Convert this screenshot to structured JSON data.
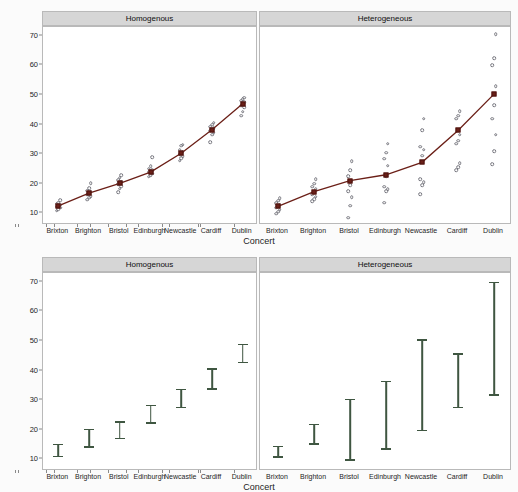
{
  "figure": {
    "xlabel": "Concert",
    "ylabel": "Ringing in Ears (Hours)",
    "panel_titles": [
      "Homogenous",
      "Heterogeneous"
    ],
    "categories": [
      "Brixton",
      "Brighton",
      "Bristol",
      "Edinburgh",
      "Newcastle",
      "Cardiff",
      "Dublin"
    ],
    "yticks": [
      10,
      20,
      30,
      40,
      50,
      60,
      70
    ],
    "ylim": [
      6,
      73
    ],
    "colors": {
      "mean_marker": "#6b1f17",
      "observation": "#77777f",
      "errorbar": "#3f5641",
      "strip_background": "#d6d6d6",
      "panel_border": "#b9b9b9",
      "background": "#fbfbfb"
    }
  },
  "chart_data": [
    {
      "type": "scatter",
      "title": "Homogenous",
      "panel": "top-left",
      "xlabel": "Concert",
      "ylabel": "Ringing in Ears (Hours)",
      "ylim": [
        6,
        73
      ],
      "yticks": [
        10,
        20,
        30,
        40,
        50,
        60,
        70
      ],
      "grid": false,
      "categories": [
        "Brixton",
        "Brighton",
        "Bristol",
        "Edinburgh",
        "Newcastle",
        "Cardiff",
        "Dublin"
      ],
      "series": [
        {
          "name": "Group mean",
          "marker": "filled-square",
          "connected": true,
          "values": [
            12.5,
            16.8,
            20.1,
            23.9,
            30.3,
            38.2,
            47.0
          ]
        }
      ],
      "observations": [
        {
          "category": "Brixton",
          "values": [
            10.9,
            11.4,
            11.8,
            12.2,
            12.5,
            12.8,
            13.2,
            13.6,
            14.3
          ]
        },
        {
          "category": "Brighton",
          "values": [
            14.5,
            15.2,
            15.8,
            16.3,
            16.8,
            17.2,
            17.6,
            18.4,
            20.2
          ]
        },
        {
          "category": "Bristol",
          "values": [
            17.0,
            18.3,
            19.2,
            19.8,
            20.1,
            20.6,
            21.2,
            22.0,
            22.8
          ]
        },
        {
          "category": "Edinburgh",
          "values": [
            22.3,
            22.9,
            23.4,
            23.8,
            24.2,
            24.6,
            25.1,
            25.8,
            28.9
          ]
        },
        {
          "category": "Newcastle",
          "values": [
            27.8,
            28.6,
            29.3,
            29.9,
            30.3,
            30.8,
            31.4,
            32.9,
            33.2
          ]
        },
        {
          "category": "Cardiff",
          "values": [
            34.1,
            36.6,
            37.3,
            37.9,
            38.2,
            38.7,
            39.3,
            40.0,
            40.6
          ]
        },
        {
          "category": "Dublin",
          "values": [
            43.0,
            44.4,
            45.8,
            46.4,
            47.0,
            47.5,
            48.1,
            48.6,
            49.1
          ]
        }
      ]
    },
    {
      "type": "scatter",
      "title": "Heterogeneous",
      "panel": "top-right",
      "xlabel": "Concert",
      "ylabel": "Ringing in Ears (Hours)",
      "ylim": [
        6,
        73
      ],
      "yticks": [
        10,
        20,
        30,
        40,
        50,
        60,
        70
      ],
      "grid": false,
      "categories": [
        "Brixton",
        "Brighton",
        "Bristol",
        "Edinburgh",
        "Newcastle",
        "Cardiff",
        "Dublin"
      ],
      "series": [
        {
          "name": "Group mean",
          "marker": "filled-square",
          "connected": true,
          "values": [
            12.3,
            17.3,
            21.0,
            23.0,
            27.2,
            38.0,
            50.3
          ]
        }
      ],
      "observations": [
        {
          "category": "Brixton",
          "values": [
            9.8,
            10.5,
            11.2,
            11.8,
            12.3,
            12.8,
            13.4,
            14.2,
            15.0
          ]
        },
        {
          "category": "Brighton",
          "values": [
            14.0,
            14.8,
            15.6,
            16.4,
            17.3,
            18.2,
            19.0,
            20.0,
            21.5
          ]
        },
        {
          "category": "Bristol",
          "values": [
            8.5,
            12.5,
            15.5,
            17.5,
            19.5,
            21.0,
            22.5,
            24.5,
            27.5
          ]
        },
        {
          "category": "Edinburgh",
          "values": [
            13.5,
            17.5,
            18.2,
            19.0,
            22.5,
            26.0,
            28.5,
            30.5,
            33.5
          ]
        },
        {
          "category": "Newcastle",
          "values": [
            16.5,
            19.5,
            20.5,
            21.5,
            29.5,
            31.5,
            32.5,
            38.0,
            42.0
          ]
        },
        {
          "category": "Cardiff",
          "values": [
            24.5,
            25.5,
            27.0,
            33.5,
            34.5,
            36.5,
            42.0,
            43.0,
            44.5
          ]
        },
        {
          "category": "Dublin",
          "values": [
            26.5,
            31.0,
            36.5,
            42.0,
            46.5,
            53.0,
            60.0,
            62.5,
            70.5
          ]
        }
      ]
    },
    {
      "type": "errorbar",
      "title": "Homogenous",
      "panel": "bottom-left",
      "xlabel": "Concert",
      "ylabel": "Ringing in Ears (Hours)",
      "ylim": [
        6,
        73
      ],
      "yticks": [
        10,
        20,
        30,
        40,
        50,
        60,
        70
      ],
      "grid": false,
      "categories": [
        "Brixton",
        "Brighton",
        "Bristol",
        "Edinburgh",
        "Newcastle",
        "Cardiff",
        "Dublin"
      ],
      "intervals": [
        {
          "category": "Brixton",
          "lower": 11.2,
          "upper": 15.2
        },
        {
          "category": "Brighton",
          "lower": 14.3,
          "upper": 20.3
        },
        {
          "category": "Bristol",
          "lower": 17.2,
          "upper": 22.8
        },
        {
          "category": "Edinburgh",
          "lower": 22.5,
          "upper": 28.5
        },
        {
          "category": "Newcastle",
          "lower": 27.8,
          "upper": 33.9
        },
        {
          "category": "Cardiff",
          "lower": 34.1,
          "upper": 40.7
        },
        {
          "category": "Dublin",
          "lower": 43.0,
          "upper": 49.1
        }
      ]
    },
    {
      "type": "errorbar",
      "title": "Heterogeneous",
      "panel": "bottom-right",
      "xlabel": "Concert",
      "ylabel": "Ringing in Ears (Hours)",
      "ylim": [
        6,
        73
      ],
      "yticks": [
        10,
        20,
        30,
        40,
        50,
        60,
        70
      ],
      "grid": false,
      "categories": [
        "Brixton",
        "Brighton",
        "Bristol",
        "Edinburgh",
        "Newcastle",
        "Cardiff",
        "Dublin"
      ],
      "intervals": [
        {
          "category": "Brixton",
          "lower": 11.0,
          "upper": 14.6
        },
        {
          "category": "Brighton",
          "lower": 15.5,
          "upper": 22.0
        },
        {
          "category": "Bristol",
          "lower": 10.0,
          "upper": 30.5
        },
        {
          "category": "Edinburgh",
          "lower": 13.8,
          "upper": 36.5
        },
        {
          "category": "Newcastle",
          "lower": 20.0,
          "upper": 50.5
        },
        {
          "category": "Cardiff",
          "lower": 27.8,
          "upper": 45.8
        },
        {
          "category": "Dublin",
          "lower": 32.0,
          "upper": 70.0
        }
      ]
    }
  ]
}
